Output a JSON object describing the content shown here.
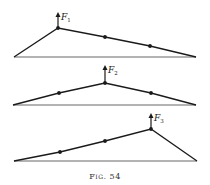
{
  "figure": {
    "caption": "Fig. 54",
    "diagrams": [
      {
        "force_label": "F",
        "force_subscript": "1",
        "baseline": [
          [
            14,
            57
          ],
          [
            196,
            57
          ]
        ],
        "string": [
          [
            14,
            57
          ],
          [
            58,
            28
          ],
          [
            105,
            37
          ],
          [
            150,
            46
          ],
          [
            196,
            57
          ]
        ],
        "load_points": [
          [
            58,
            28
          ],
          [
            105,
            37
          ],
          [
            150,
            46
          ]
        ],
        "force_point": [
          58,
          28
        ],
        "arrow_tip": [
          58,
          12
        ]
      },
      {
        "force_label": "F",
        "force_subscript": "2",
        "baseline": [
          [
            13,
            105
          ],
          [
            196,
            105
          ]
        ],
        "string": [
          [
            13,
            105
          ],
          [
            59,
            93
          ],
          [
            105,
            83
          ],
          [
            151,
            93
          ],
          [
            196,
            105
          ]
        ],
        "load_points": [
          [
            59,
            93
          ],
          [
            105,
            83
          ],
          [
            151,
            93
          ]
        ],
        "force_point": [
          105,
          83
        ],
        "arrow_tip": [
          105,
          65
        ]
      },
      {
        "force_label": "F",
        "force_subscript": "3",
        "baseline": [
          [
            14,
            161
          ],
          [
            197,
            161
          ]
        ],
        "string": [
          [
            14,
            161
          ],
          [
            60,
            152
          ],
          [
            105,
            141
          ],
          [
            151,
            129
          ],
          [
            197,
            161
          ]
        ],
        "load_points": [
          [
            60,
            152
          ],
          [
            105,
            141
          ],
          [
            151,
            129
          ]
        ],
        "force_point": [
          151,
          129
        ],
        "arrow_tip": [
          151,
          113
        ]
      }
    ],
    "colors": {
      "ink": "#1a1a1a",
      "baseline": "#555555"
    }
  }
}
